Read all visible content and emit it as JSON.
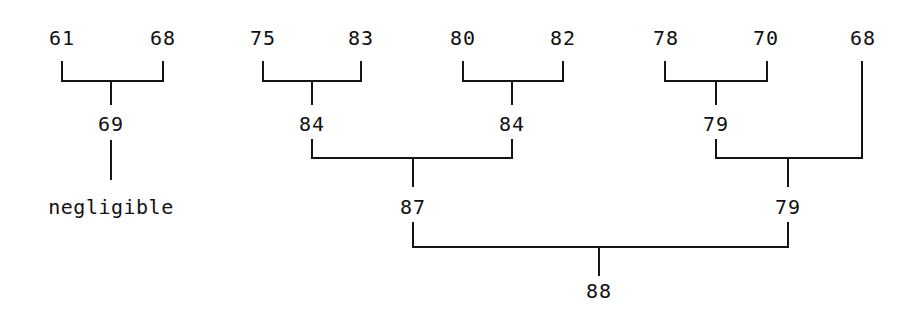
{
  "figure": {
    "type": "hierarchical-clustering-dendrogram",
    "ink_color": "#141414",
    "background_color": "#ffffff"
  },
  "nodes": {
    "leaves": [
      {
        "id": "leaf-61",
        "label": "61",
        "x": 62,
        "y": 40
      },
      {
        "id": "leaf-68a",
        "label": "68",
        "x": 163,
        "y": 40
      },
      {
        "id": "leaf-75",
        "label": "75",
        "x": 263,
        "y": 40
      },
      {
        "id": "leaf-83",
        "label": "83",
        "x": 361,
        "y": 40
      },
      {
        "id": "leaf-80",
        "label": "80",
        "x": 463,
        "y": 40
      },
      {
        "id": "leaf-82",
        "label": "82",
        "x": 563,
        "y": 40
      },
      {
        "id": "leaf-78",
        "label": "78",
        "x": 666,
        "y": 40
      },
      {
        "id": "leaf-70",
        "label": "70",
        "x": 766,
        "y": 40
      },
      {
        "id": "leaf-68b",
        "label": "68",
        "x": 863,
        "y": 40
      }
    ],
    "internal": [
      {
        "id": "node-69",
        "label": "69",
        "x": 111,
        "y": 126
      },
      {
        "id": "node-84a",
        "label": "84",
        "x": 312,
        "y": 126
      },
      {
        "id": "node-84b",
        "label": "84",
        "x": 512,
        "y": 126
      },
      {
        "id": "node-79a",
        "label": "79",
        "x": 716,
        "y": 126
      },
      {
        "id": "node-87",
        "label": "87",
        "x": 413,
        "y": 209
      },
      {
        "id": "node-79b",
        "label": "79",
        "x": 788,
        "y": 209
      },
      {
        "id": "node-88",
        "label": "88",
        "x": 599,
        "y": 292
      }
    ],
    "terminal": [
      {
        "id": "terminal-negligible",
        "label": "negligible",
        "x": 111,
        "y": 209
      }
    ]
  },
  "merges": [
    {
      "id": "merge-69",
      "parent": "69",
      "children": [
        "61",
        "68"
      ]
    },
    {
      "id": "merge-84a",
      "parent": "84",
      "children": [
        "75",
        "83"
      ]
    },
    {
      "id": "merge-84b",
      "parent": "84",
      "children": [
        "80",
        "82"
      ]
    },
    {
      "id": "merge-87",
      "parent": "87",
      "children": [
        "84",
        "84"
      ]
    },
    {
      "id": "merge-79a",
      "parent": "79",
      "children": [
        "78",
        "70"
      ]
    },
    {
      "id": "merge-79b",
      "parent": "79",
      "children": [
        "79",
        "68"
      ]
    },
    {
      "id": "merge-88",
      "parent": "88",
      "children": [
        "87",
        "79"
      ]
    },
    {
      "id": "chain-negligible",
      "parent": "negligible",
      "children": [
        "69"
      ]
    }
  ]
}
